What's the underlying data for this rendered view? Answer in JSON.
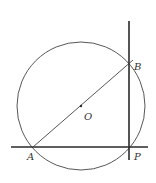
{
  "diagram": {
    "colors": {
      "line": "#2a2a2a",
      "thin_line": "#444444",
      "background": "#ffffff"
    },
    "circle": {
      "cx": 81,
      "cy": 106,
      "r": 64
    },
    "points": {
      "A": {
        "x": 33,
        "y": 147,
        "label": "A",
        "label_x": 27,
        "label_y": 160
      },
      "B": {
        "x": 129,
        "y": 64,
        "label": "B",
        "label_x": 134,
        "label_y": 70
      },
      "O": {
        "x": 81,
        "y": 106,
        "label": "O",
        "label_x": 84,
        "label_y": 120
      },
      "P": {
        "x": 129,
        "y": 147,
        "label": "P",
        "label_x": 134,
        "label_y": 160
      }
    },
    "lines": {
      "horizontal": {
        "x1": 11,
        "y1": 147,
        "x2": 148,
        "y2": 147
      },
      "vertical": {
        "x1": 129,
        "y1": 21,
        "x2": 129,
        "y2": 160
      },
      "segment_AB": {
        "x1": 33,
        "y1": 147,
        "x2": 133,
        "y2": 60
      }
    }
  }
}
